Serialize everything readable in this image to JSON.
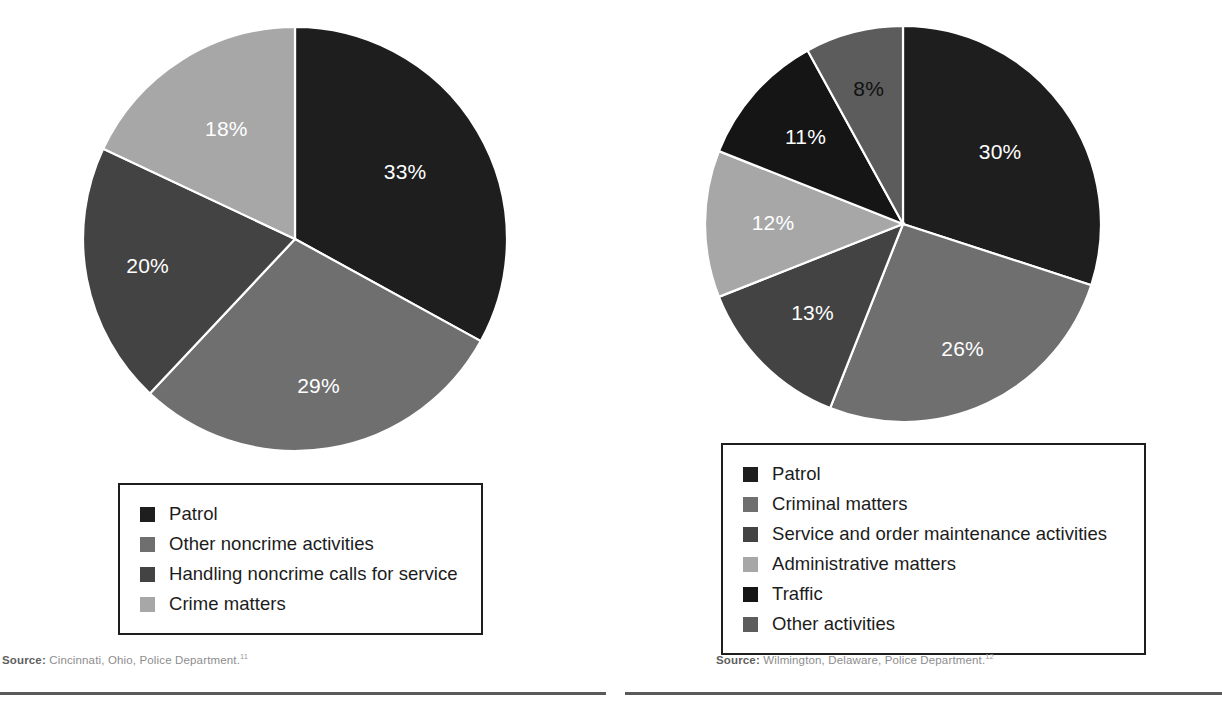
{
  "palette": {
    "near_black": "#1e1e1e",
    "black_alt": "#151515",
    "dark_gray": "#434343",
    "mid_dark_gray": "#5c5c5c",
    "mid_gray": "#6f6f6f",
    "light_gray": "#a7a7a7",
    "white": "#ffffff",
    "rule_gray": "#5a5a5a",
    "source_gray": "#8d8d8d",
    "legend_border": "#1e1e1e"
  },
  "chart_data": [
    {
      "type": "pie",
      "id": "cincinnati",
      "title": "",
      "categories": [
        "Patrol",
        "Other noncrime activities",
        "Handling noncrime calls for service",
        "Crime matters"
      ],
      "values": [
        33,
        29,
        20,
        18
      ],
      "value_labels": [
        "33%",
        "29%",
        "20%",
        "18%"
      ],
      "colors": [
        "#1e1e1e",
        "#6f6f6f",
        "#434343",
        "#a7a7a7"
      ],
      "label_colors": [
        "#ffffff",
        "#ffffff",
        "#ffffff",
        "#ffffff"
      ],
      "units": "percent",
      "start_angle_deg": 0,
      "direction": "clockwise",
      "legend_position": "below",
      "grid": false
    },
    {
      "type": "pie",
      "id": "wilmington",
      "title": "",
      "categories": [
        "Patrol",
        "Criminal matters",
        "Service and order maintenance activities",
        "Administrative matters",
        "Traffic",
        "Other activities"
      ],
      "values": [
        30,
        26,
        13,
        12,
        11,
        8
      ],
      "value_labels": [
        "30%",
        "26%",
        "13%",
        "12%",
        "11%",
        "8%"
      ],
      "colors": [
        "#1e1e1e",
        "#6f6f6f",
        "#434343",
        "#a7a7a7",
        "#151515",
        "#5c5c5c"
      ],
      "label_colors": [
        "#ffffff",
        "#ffffff",
        "#ffffff",
        "#ffffff",
        "#ffffff",
        "#111111"
      ],
      "units": "percent",
      "start_angle_deg": 0,
      "direction": "clockwise",
      "legend_position": "below",
      "grid": false
    }
  ],
  "left": {
    "legend": {
      "items": [
        {
          "label": "Patrol",
          "color": "#1e1e1e"
        },
        {
          "label": "Other noncrime activities",
          "color": "#6f6f6f"
        },
        {
          "label": "Handling noncrime calls for service",
          "color": "#434343"
        },
        {
          "label": "Crime matters",
          "color": "#a7a7a7"
        }
      ]
    },
    "source": {
      "word": "Source:",
      "text": " Cincinnati, Ohio, Police Department.",
      "note": "11"
    }
  },
  "right": {
    "legend": {
      "items": [
        {
          "label": "Patrol",
          "color": "#1e1e1e"
        },
        {
          "label": "Criminal matters",
          "color": "#6f6f6f"
        },
        {
          "label": "Service and order maintenance activities",
          "color": "#434343"
        },
        {
          "label": "Administrative matters",
          "color": "#a7a7a7"
        },
        {
          "label": "Traffic",
          "color": "#151515"
        },
        {
          "label": "Other activities",
          "color": "#5c5c5c"
        }
      ]
    },
    "source": {
      "word": "Source:",
      "text": " Wilmington, Delaware, Police Department.",
      "note": "12"
    }
  }
}
